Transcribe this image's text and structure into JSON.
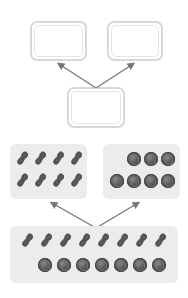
{
  "diagram": {
    "type": "part-whole number bond",
    "top_section": {
      "whole_box": {
        "value": ""
      },
      "part_boxes": [
        {
          "value": ""
        },
        {
          "value": ""
        }
      ]
    },
    "bottom_section": {
      "whole": {
        "peanuts": 8,
        "walnuts": 7,
        "total": 15
      },
      "parts": [
        {
          "item": "peanut",
          "count": 8,
          "icon": "peanut-icon"
        },
        {
          "item": "walnut",
          "count": 7,
          "icon": "walnut-icon"
        }
      ]
    },
    "colors": {
      "box_border": "#d8d8d8",
      "panel_bg": "#ececec",
      "arrow": "#777777",
      "item": "#555555"
    }
  }
}
